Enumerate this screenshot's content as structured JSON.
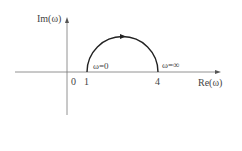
{
  "diagram": {
    "type": "nyquist-plot",
    "axes": {
      "y_label": "Im(ω)",
      "x_label": "Re(ω)"
    },
    "ticks": {
      "origin": "0",
      "start": "1",
      "end": "4"
    },
    "annotations": {
      "omega_zero": "ω=0",
      "omega_inf": "ω=∞"
    },
    "curve": {
      "shape": "upper semicircle",
      "from": 1,
      "to": 4,
      "direction": "clockwise from ω=0 to ω=∞",
      "color": "#222222"
    }
  }
}
